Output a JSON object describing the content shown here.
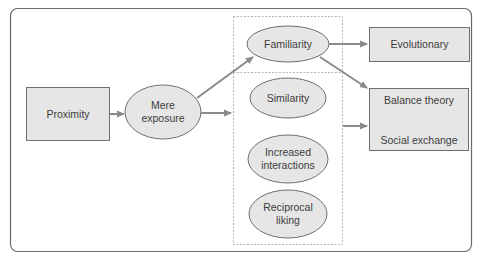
{
  "diagram": {
    "nodes": {
      "proximity": {
        "label": "Proximity",
        "shape": "rect"
      },
      "mere_exposure": {
        "label_line1": "Mere",
        "label_line2": "exposure",
        "shape": "ellipse"
      },
      "familiarity": {
        "label": "Familiarity",
        "shape": "ellipse"
      },
      "similarity": {
        "label": "Similarity",
        "shape": "ellipse"
      },
      "increased_interactions": {
        "label_line1": "Increased",
        "label_line2": "interactions",
        "shape": "ellipse"
      },
      "reciprocal_liking": {
        "label_line1": "Reciprocal",
        "label_line2": "liking",
        "shape": "ellipse"
      },
      "evolutionary": {
        "label": "Evolutionary",
        "shape": "rect"
      },
      "balance_social": {
        "label_top": "Balance theory",
        "label_bottom": "Social exchange",
        "shape": "rect"
      }
    },
    "edges": [
      {
        "from": "Proximity",
        "to": "Mere exposure"
      },
      {
        "from": "Mere exposure",
        "to": "Familiarity"
      },
      {
        "from": "Mere exposure",
        "to": "Similarity / Increased interactions / Reciprocal liking group"
      },
      {
        "from": "Familiarity",
        "to": "Evolutionary"
      },
      {
        "from": "Familiarity",
        "to": "Balance theory / Social exchange"
      },
      {
        "from": "Similarity / Increased interactions / Reciprocal liking group",
        "to": "Balance theory / Social exchange"
      }
    ],
    "colors": {
      "node_fill": "#e6e6e6",
      "node_stroke": "#6f6f6f",
      "arrow": "#8a8a8a",
      "frame": "#6a6a6a",
      "dashed": "#b5b5b5"
    }
  }
}
